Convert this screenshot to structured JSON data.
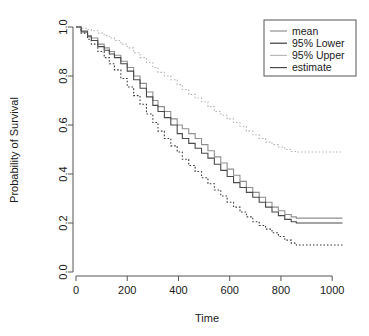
{
  "chart_data": {
    "type": "line",
    "title": "",
    "xlabel": "Time",
    "ylabel": "Probability of Survival",
    "xlim": [
      0,
      1050
    ],
    "ylim": [
      0,
      1.0
    ],
    "grid": false,
    "legend_position": "top-right",
    "xticks": [
      0,
      200,
      400,
      600,
      800,
      1000
    ],
    "xtick_labels": [
      "0",
      "200",
      "400",
      "600",
      "800",
      "1000"
    ],
    "yticks": [
      0.0,
      0.2,
      0.4,
      0.6,
      0.8,
      1.0
    ],
    "ytick_labels": [
      "0.0",
      "0.2",
      "0.4",
      "0.6",
      "0.8",
      "1.0"
    ],
    "step_style": "post",
    "series": [
      {
        "name": "mean",
        "color": "#8f8f8f",
        "dash": "none",
        "x": [
          0,
          20,
          45,
          60,
          85,
          110,
          130,
          150,
          175,
          200,
          225,
          250,
          275,
          300,
          320,
          345,
          370,
          395,
          415,
          440,
          465,
          490,
          515,
          540,
          565,
          590,
          615,
          640,
          665,
          690,
          715,
          740,
          765,
          790,
          815,
          840,
          860,
          1040
        ],
        "y": [
          1.0,
          0.985,
          0.965,
          0.955,
          0.93,
          0.915,
          0.9,
          0.885,
          0.86,
          0.835,
          0.8,
          0.77,
          0.735,
          0.7,
          0.675,
          0.655,
          0.625,
          0.6,
          0.585,
          0.565,
          0.545,
          0.52,
          0.495,
          0.47,
          0.445,
          0.42,
          0.395,
          0.37,
          0.345,
          0.325,
          0.305,
          0.285,
          0.265,
          0.25,
          0.235,
          0.225,
          0.22,
          0.22
        ]
      },
      {
        "name": "95% Lower",
        "color": "#3a3a3a",
        "dash": "dotted",
        "x": [
          0,
          20,
          45,
          60,
          85,
          110,
          130,
          150,
          175,
          200,
          225,
          250,
          275,
          300,
          320,
          345,
          370,
          395,
          415,
          440,
          465,
          490,
          515,
          540,
          565,
          590,
          615,
          640,
          665,
          690,
          715,
          740,
          765,
          790,
          815,
          840,
          860,
          1040
        ],
        "y": [
          1.0,
          0.975,
          0.95,
          0.93,
          0.9,
          0.875,
          0.85,
          0.825,
          0.79,
          0.755,
          0.72,
          0.685,
          0.645,
          0.61,
          0.575,
          0.545,
          0.515,
          0.49,
          0.46,
          0.435,
          0.41,
          0.385,
          0.36,
          0.335,
          0.31,
          0.285,
          0.265,
          0.245,
          0.225,
          0.205,
          0.19,
          0.175,
          0.16,
          0.145,
          0.13,
          0.118,
          0.11,
          0.11
        ]
      },
      {
        "name": "95% Upper",
        "color": "#b8b8b8",
        "dash": "dotted",
        "x": [
          0,
          20,
          45,
          60,
          85,
          110,
          130,
          150,
          175,
          200,
          225,
          250,
          275,
          300,
          320,
          345,
          370,
          395,
          415,
          440,
          465,
          490,
          515,
          540,
          565,
          590,
          615,
          640,
          665,
          690,
          715,
          740,
          765,
          790,
          815,
          840,
          860,
          1040
        ],
        "y": [
          1.0,
          0.995,
          0.99,
          0.985,
          0.975,
          0.965,
          0.955,
          0.945,
          0.93,
          0.915,
          0.895,
          0.875,
          0.855,
          0.835,
          0.815,
          0.8,
          0.785,
          0.765,
          0.745,
          0.725,
          0.71,
          0.695,
          0.675,
          0.655,
          0.64,
          0.625,
          0.61,
          0.595,
          0.575,
          0.56,
          0.545,
          0.53,
          0.52,
          0.51,
          0.5,
          0.492,
          0.49,
          0.49
        ]
      },
      {
        "name": "estimate",
        "color": "#4a4a4a",
        "dash": "none",
        "x": [
          0,
          20,
          45,
          60,
          85,
          110,
          130,
          150,
          175,
          200,
          225,
          250,
          275,
          300,
          320,
          345,
          370,
          395,
          415,
          440,
          465,
          490,
          515,
          540,
          565,
          590,
          615,
          640,
          665,
          690,
          715,
          740,
          765,
          790,
          815,
          840,
          860,
          1040
        ],
        "y": [
          1.0,
          0.98,
          0.96,
          0.945,
          0.92,
          0.905,
          0.89,
          0.875,
          0.85,
          0.82,
          0.785,
          0.75,
          0.715,
          0.68,
          0.655,
          0.63,
          0.6,
          0.565,
          0.545,
          0.525,
          0.505,
          0.485,
          0.465,
          0.44,
          0.415,
          0.39,
          0.365,
          0.345,
          0.325,
          0.305,
          0.285,
          0.265,
          0.245,
          0.23,
          0.215,
          0.205,
          0.2,
          0.2
        ]
      }
    ],
    "legend_entries": [
      {
        "label": "mean",
        "color": "#8f8f8f",
        "dash": "none"
      },
      {
        "label": "95% Lower",
        "color": "#3a3a3a",
        "dash": "none"
      },
      {
        "label": "95% Upper",
        "color": "#b8b8b8",
        "dash": "none"
      },
      {
        "label": "estimate",
        "color": "#4a4a4a",
        "dash": "none"
      }
    ]
  }
}
